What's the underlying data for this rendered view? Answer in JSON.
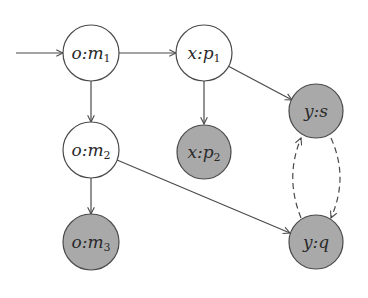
{
  "diagram": {
    "type": "directed-graph",
    "colors": {
      "background": "#ffffff",
      "stroke": "#4a4a4a",
      "unfilled_node": "#ffffff",
      "filled_node": "#a9a9a9",
      "text": "#2a2a2a"
    },
    "nodes": [
      {
        "id": "o_m1",
        "prefix": "o:",
        "var": "m",
        "sub": "1",
        "filled": false
      },
      {
        "id": "x_p1",
        "prefix": "x:",
        "var": "p",
        "sub": "1",
        "filled": false
      },
      {
        "id": "y_s",
        "prefix": "y:",
        "var": "s",
        "sub": "",
        "filled": true
      },
      {
        "id": "o_m2",
        "prefix": "o:",
        "var": "m",
        "sub": "2",
        "filled": false
      },
      {
        "id": "x_p2",
        "prefix": "x:",
        "var": "p",
        "sub": "2",
        "filled": true
      },
      {
        "id": "o_m3",
        "prefix": "o:",
        "var": "m",
        "sub": "3",
        "filled": true
      },
      {
        "id": "y_q",
        "prefix": "y:",
        "var": "q",
        "sub": "",
        "filled": true
      }
    ],
    "edges": [
      {
        "from": "start",
        "to": "o_m1",
        "style": "solid"
      },
      {
        "from": "o_m1",
        "to": "x_p1",
        "style": "solid"
      },
      {
        "from": "o_m1",
        "to": "o_m2",
        "style": "solid"
      },
      {
        "from": "x_p1",
        "to": "x_p2",
        "style": "solid"
      },
      {
        "from": "x_p1",
        "to": "y_s",
        "style": "solid"
      },
      {
        "from": "o_m2",
        "to": "o_m3",
        "style": "solid"
      },
      {
        "from": "o_m2",
        "to": "y_q",
        "style": "solid"
      },
      {
        "from": "y_s",
        "to": "y_q",
        "style": "dashed"
      },
      {
        "from": "y_q",
        "to": "y_s",
        "style": "dashed"
      }
    ]
  }
}
